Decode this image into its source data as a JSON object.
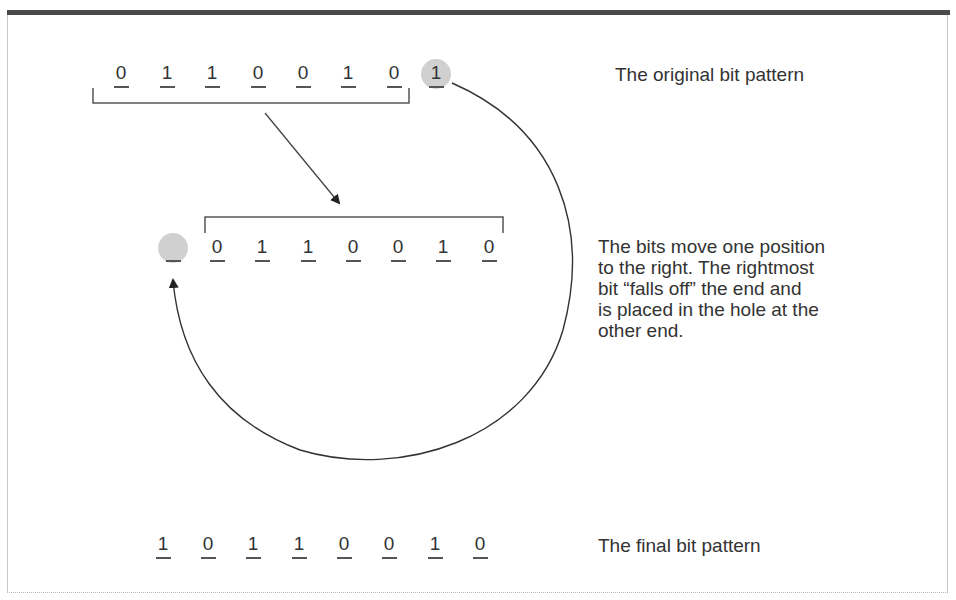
{
  "figure": {
    "original": {
      "bits": [
        "0",
        "1",
        "1",
        "0",
        "0",
        "1",
        "0",
        "1"
      ],
      "caption": "The original bit pattern"
    },
    "shifted": {
      "hole": "_",
      "bits": [
        "0",
        "1",
        "1",
        "0",
        "0",
        "1",
        "0"
      ],
      "caption_lines": [
        "The bits move one position",
        "to the right. The rightmost",
        "bit “falls off” the end and",
        "is placed in the hole at the",
        "other end."
      ]
    },
    "final": {
      "bits": [
        "1",
        "0",
        "1",
        "1",
        "0",
        "0",
        "1",
        "0"
      ],
      "caption": "The final bit pattern"
    }
  },
  "colors": {
    "ink": "#333333",
    "hole_fill": "#d0d0d0",
    "header_bar": "#4a4a4a"
  }
}
